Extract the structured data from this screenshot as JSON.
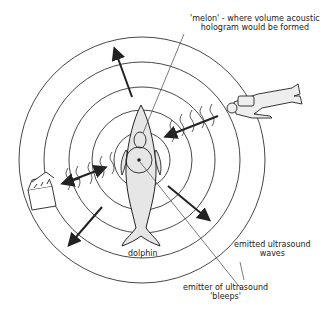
{
  "labels": {
    "melon_line1": "'melon' - where volume acoustic",
    "melon_line2": "hologram would be formed",
    "dolphin": "dolphin",
    "emitter_line1": "emitter of ultrasound",
    "emitter_line2": "'bleeps'",
    "waves_line1": "emitted ultrasound",
    "waves_line2": "waves"
  },
  "colors": {
    "ink": "#222222",
    "fill": "#e6e6e6"
  }
}
